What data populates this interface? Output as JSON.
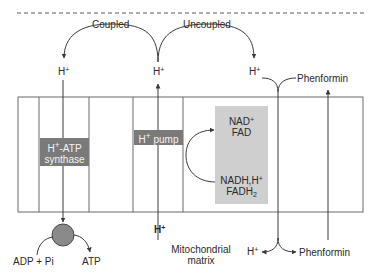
{
  "diagram": {
    "type": "mitochondrial membrane proton flow schematic",
    "colors": {
      "line": "#4a4a4a",
      "membrane_border": "#6a6a6a",
      "protein_box": "#7a7a7a",
      "protein_text": "#f4f4f4",
      "cofactor_box": "#cfcfcf",
      "atp_circle": "#8a8a8a",
      "text": "#2a2a2a"
    },
    "top_labels": {
      "coupled": "Coupled",
      "uncoupled": "Uncoupled"
    },
    "proton_labels": {
      "h_left_top": "H",
      "h_mid_top": "H",
      "h_right_top": "H",
      "h_mid_bottom": "H",
      "h_right_bottom": "H",
      "plus": "+"
    },
    "phenformin": {
      "top": "Phenformin",
      "bottom": "Phenformin"
    },
    "proteins": {
      "atp_synthase_line1_prefix": "H",
      "atp_synthase_line1_suffix": "-ATP",
      "atp_synthase_line2": "synthase",
      "pump_prefix": "H",
      "pump_suffix": " pump"
    },
    "cofactors": {
      "oxidized_line1_prefix": "NAD",
      "oxidized_line2": "FAD",
      "reduced_line1_prefix": "NADH,H",
      "reduced_line2_prefix": "FADH",
      "reduced_line2_subscript": "2"
    },
    "atp_reaction": {
      "substrate": "ADP + Pi",
      "product": "ATP"
    },
    "compartment": {
      "line1": "Mitochondrial",
      "line2": "matrix"
    }
  }
}
